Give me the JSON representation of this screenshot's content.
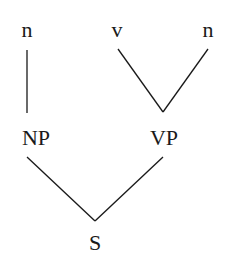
{
  "diagram": {
    "type": "syntax-tree",
    "nodes": [
      {
        "id": "n1",
        "label": "n",
        "x": 27,
        "y": 37
      },
      {
        "id": "v",
        "label": "v",
        "x": 117,
        "y": 37
      },
      {
        "id": "n2",
        "label": "n",
        "x": 208,
        "y": 37
      },
      {
        "id": "np",
        "label": "NP",
        "x": 36,
        "y": 145
      },
      {
        "id": "vp",
        "label": "VP",
        "x": 164,
        "y": 145
      },
      {
        "id": "s",
        "label": "S",
        "x": 95,
        "y": 250
      }
    ],
    "edges": [
      {
        "from": "n1",
        "to": "np"
      },
      {
        "from": "v",
        "to": "vp"
      },
      {
        "from": "n2",
        "to": "vp"
      },
      {
        "from": "np",
        "to": "s"
      },
      {
        "from": "vp",
        "to": "s"
      }
    ]
  }
}
